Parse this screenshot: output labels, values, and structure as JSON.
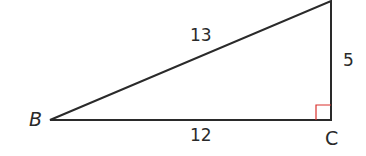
{
  "diagram": {
    "type": "right-triangle",
    "vertices": {
      "B": {
        "label": "B",
        "x": 50,
        "y": 120
      },
      "C": {
        "label": "C",
        "x": 331,
        "y": 120
      },
      "top": {
        "label": "",
        "x": 331,
        "y": 1
      }
    },
    "sides": {
      "hypotenuse": {
        "label": "13"
      },
      "base": {
        "label": "12"
      },
      "vertical": {
        "label": "5"
      }
    },
    "right_angle_at": "C",
    "colors": {
      "line": "#2a2a2a",
      "right_angle_marker": "#d9302c",
      "text": "#2a2a2a"
    }
  }
}
